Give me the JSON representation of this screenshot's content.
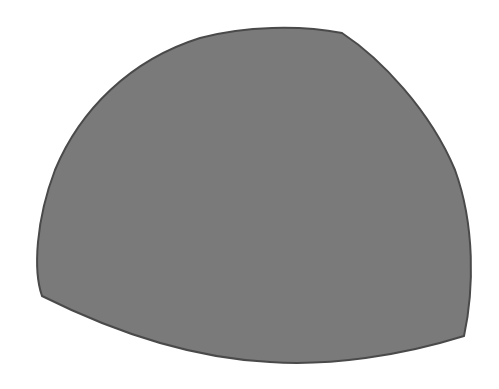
{
  "figure": {
    "shape": "curved-triangle",
    "fill_color": "#7a7a7a",
    "stroke_color": "#4a4a4a",
    "background_color": "#ffffff"
  }
}
